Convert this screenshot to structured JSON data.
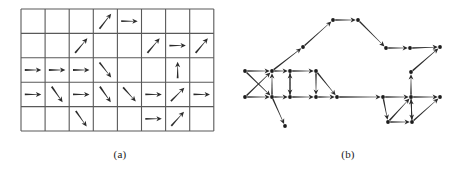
{
  "figure": {
    "panels": [
      {
        "id": "a",
        "caption": "(a)",
        "description": "grid of directional arrows"
      },
      {
        "id": "b",
        "caption": "(b)",
        "description": "directed graph of nodes and arrows"
      }
    ],
    "stroke_color": "#2b2b2b",
    "grid_line_color": "#595959",
    "node_color": "#1c1c1c",
    "background_color": "#ffffff"
  },
  "panel_a": {
    "grid": {
      "x": 21,
      "y": 9,
      "cols": 8,
      "rows": 5,
      "cell_w": 24.1,
      "cell_h": 24.4
    },
    "arrows": [
      {
        "row": 1,
        "col": 4,
        "direction": "up-right",
        "angle": -52
      },
      {
        "row": 1,
        "col": 5,
        "direction": "right",
        "angle": 0
      },
      {
        "row": 2,
        "col": 3,
        "direction": "up-right",
        "angle": -50
      },
      {
        "row": 2,
        "col": 6,
        "direction": "up-right",
        "angle": -50
      },
      {
        "row": 2,
        "col": 7,
        "direction": "right",
        "angle": 0
      },
      {
        "row": 2,
        "col": 8,
        "direction": "up-right",
        "angle": -50
      },
      {
        "row": 3,
        "col": 1,
        "direction": "right",
        "angle": 0
      },
      {
        "row": 3,
        "col": 2,
        "direction": "right",
        "angle": 0
      },
      {
        "row": 3,
        "col": 3,
        "direction": "right",
        "angle": 0
      },
      {
        "row": 3,
        "col": 4,
        "direction": "down-right",
        "angle": 52
      },
      {
        "row": 3,
        "col": 7,
        "direction": "up",
        "angle": -90
      },
      {
        "row": 4,
        "col": 1,
        "direction": "right",
        "angle": 0
      },
      {
        "row": 4,
        "col": 2,
        "direction": "down-right",
        "angle": 55
      },
      {
        "row": 4,
        "col": 3,
        "direction": "right",
        "angle": 0
      },
      {
        "row": 4,
        "col": 4,
        "direction": "down-right",
        "angle": 55
      },
      {
        "row": 4,
        "col": 5,
        "direction": "down-right",
        "angle": 48
      },
      {
        "row": 4,
        "col": 6,
        "direction": "right",
        "angle": 0
      },
      {
        "row": 4,
        "col": 7,
        "direction": "up-right",
        "angle": -45
      },
      {
        "row": 4,
        "col": 8,
        "direction": "right",
        "angle": 0
      },
      {
        "row": 5,
        "col": 3,
        "direction": "down-right",
        "angle": 55
      },
      {
        "row": 5,
        "col": 6,
        "direction": "right",
        "angle": 0
      },
      {
        "row": 5,
        "col": 7,
        "direction": "up-right",
        "angle": -48
      }
    ]
  },
  "panel_b": {
    "nodes": [
      {
        "id": "n1",
        "x": 245,
        "y": 71
      },
      {
        "id": "n2",
        "x": 272,
        "y": 71
      },
      {
        "id": "n3",
        "x": 290,
        "y": 71
      },
      {
        "id": "n4",
        "x": 316,
        "y": 71
      },
      {
        "id": "n5",
        "x": 245,
        "y": 97
      },
      {
        "id": "n6",
        "x": 272,
        "y": 97
      },
      {
        "id": "n7",
        "x": 290,
        "y": 97
      },
      {
        "id": "n8",
        "x": 316,
        "y": 97
      },
      {
        "id": "n9",
        "x": 337,
        "y": 97
      },
      {
        "id": "n10",
        "x": 303,
        "y": 47
      },
      {
        "id": "n11",
        "x": 333,
        "y": 20
      },
      {
        "id": "n12",
        "x": 358,
        "y": 20
      },
      {
        "id": "n13",
        "x": 386,
        "y": 48
      },
      {
        "id": "n14",
        "x": 410,
        "y": 48
      },
      {
        "id": "n15",
        "x": 440,
        "y": 47
      },
      {
        "id": "n16",
        "x": 411,
        "y": 72
      },
      {
        "id": "n17",
        "x": 383,
        "y": 97
      },
      {
        "id": "n18",
        "x": 411,
        "y": 97
      },
      {
        "id": "n19",
        "x": 440,
        "y": 97
      },
      {
        "id": "n20",
        "x": 388,
        "y": 122
      },
      {
        "id": "n21",
        "x": 412,
        "y": 122
      },
      {
        "id": "n22",
        "x": 285,
        "y": 126
      }
    ],
    "edges": [
      {
        "from": "n1",
        "to": "n2"
      },
      {
        "from": "n1",
        "to": "n6"
      },
      {
        "from": "n5",
        "to": "n2"
      },
      {
        "from": "n5",
        "to": "n6"
      },
      {
        "from": "n2",
        "to": "n3"
      },
      {
        "from": "n2",
        "to": "n10"
      },
      {
        "from": "n6",
        "to": "n2"
      },
      {
        "from": "n6",
        "to": "n7"
      },
      {
        "from": "n6",
        "to": "n22"
      },
      {
        "from": "n3",
        "to": "n4"
      },
      {
        "from": "n3",
        "to": "n7"
      },
      {
        "from": "n7",
        "to": "n3"
      },
      {
        "from": "n7",
        "to": "n8"
      },
      {
        "from": "n4",
        "to": "n8"
      },
      {
        "from": "n4",
        "to": "n9"
      },
      {
        "from": "n8",
        "to": "n9"
      },
      {
        "from": "n10",
        "to": "n11"
      },
      {
        "from": "n11",
        "to": "n12"
      },
      {
        "from": "n12",
        "to": "n13"
      },
      {
        "from": "n13",
        "to": "n14"
      },
      {
        "from": "n14",
        "to": "n15"
      },
      {
        "from": "n16",
        "to": "n15"
      },
      {
        "from": "n9",
        "to": "n17"
      },
      {
        "from": "n17",
        "to": "n18"
      },
      {
        "from": "n17",
        "to": "n20"
      },
      {
        "from": "n18",
        "to": "n19"
      },
      {
        "from": "n18",
        "to": "n16"
      },
      {
        "from": "n18",
        "to": "n21"
      },
      {
        "from": "n20",
        "to": "n21"
      },
      {
        "from": "n20",
        "to": "n18"
      },
      {
        "from": "n21",
        "to": "n18"
      },
      {
        "from": "n21",
        "to": "n19"
      }
    ]
  }
}
